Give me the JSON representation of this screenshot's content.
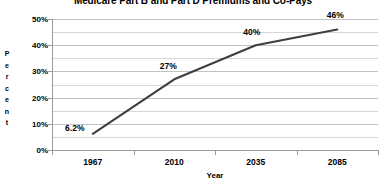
{
  "chart_data": {
    "type": "line",
    "title": "Medicare Part B and Part D Premiums and Co-Pays",
    "xlabel": "Year",
    "ylabel": "Percent",
    "categories": [
      "1967",
      "2010",
      "2035",
      "2085"
    ],
    "values": [
      6.2,
      27,
      40,
      46
    ],
    "data_labels": [
      "6.2%",
      "27%",
      "40%",
      "46%"
    ],
    "ylim": [
      0,
      50
    ],
    "ytick_labels": [
      "0%",
      "10%",
      "20%",
      "30%",
      "40%",
      "50%"
    ],
    "ytick_values": [
      0,
      10,
      20,
      30,
      40,
      50
    ],
    "minor_gridline_step": 5,
    "grid": true,
    "legend": "none",
    "series": [
      {
        "name": "Medicare Part B and Part D Premiums and Co-Pays",
        "values": [
          6.2,
          27,
          40,
          46
        ],
        "color": "#3f3f3f"
      }
    ],
    "colors": {
      "line": "#3f3f3f",
      "gridline": "#d6d6d6",
      "axis": "#9a9a9a",
      "text": "#000000",
      "background": "#ffffff"
    }
  }
}
